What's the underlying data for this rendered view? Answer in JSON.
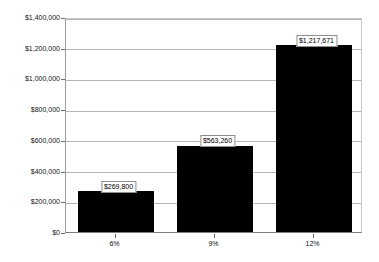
{
  "chart_data": {
    "type": "bar",
    "title": "",
    "subtitle": "",
    "xlabel": "",
    "ylabel": "",
    "categories": [
      "6%",
      "9%",
      "12%"
    ],
    "values": [
      269800,
      563260,
      1217671
    ],
    "data_labels": [
      "$269,800",
      "$563,260",
      "$1,217,671"
    ],
    "series": [
      {
        "name": "",
        "values": [
          269800,
          563260,
          1217671
        ],
        "color": "#000000"
      }
    ],
    "ylim": [
      0,
      1400000
    ],
    "ytick_step": 200000,
    "ytick_labels": [
      "$1,400,000",
      "$1,200,000",
      "$1,000,000",
      "$800,000",
      "$600,000",
      "$400,000",
      "$200,000",
      "$0"
    ],
    "ytick_values": [
      1400000,
      1200000,
      1000000,
      800000,
      600000,
      400000,
      200000,
      0
    ],
    "grid": true,
    "grid_axis": "y",
    "legend": false,
    "legend_position": "none",
    "background_color": "#ffffff",
    "bar_color": "#000000",
    "gridline_color": "#b5b5b5",
    "axis_color": "#7d7d7d",
    "label_box_border_color": "#8d8d8d",
    "label_box_fill": "#ffffff"
  }
}
